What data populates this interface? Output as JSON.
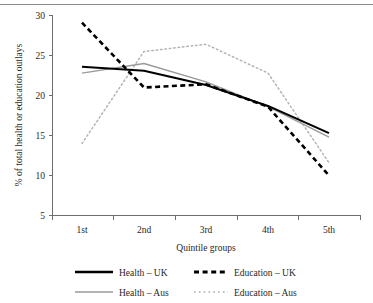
{
  "chart_data": {
    "type": "line",
    "title": "",
    "xlabel": "Quintile groups",
    "ylabel": "% of total health or education outlays",
    "categories": [
      "1st",
      "2nd",
      "3rd",
      "4th",
      "5th"
    ],
    "ylim": [
      5,
      30
    ],
    "yticks": [
      5,
      10,
      15,
      20,
      25,
      30
    ],
    "grid": false,
    "legend_position": "bottom",
    "series": [
      {
        "name": "Health – UK",
        "color": "#000000",
        "style": "solid",
        "values": [
          23.6,
          23.1,
          21.3,
          18.7,
          15.3
        ]
      },
      {
        "name": "Education – UK",
        "color": "#000000",
        "style": "dashed",
        "values": [
          29.1,
          21.0,
          21.4,
          18.6,
          10.0
        ]
      },
      {
        "name": "Health – Aus",
        "color": "#9a9a9a",
        "style": "solid",
        "values": [
          22.8,
          24.0,
          21.7,
          18.6,
          14.8
        ]
      },
      {
        "name": "Education – Aus",
        "color": "#b4b4b4",
        "style": "dotted",
        "values": [
          14.0,
          25.5,
          26.4,
          22.8,
          11.6
        ]
      }
    ]
  },
  "axes": {
    "y_tick_labels": [
      "30",
      "25",
      "20",
      "15",
      "10",
      "5"
    ],
    "x_tick_labels": [
      "1st",
      "2nd",
      "3rd",
      "4th",
      "5th"
    ],
    "x_axis_title": "Quintile groups",
    "y_axis_title": "% of total health or education outlays"
  },
  "legend": {
    "items": [
      {
        "label": "Health – UK"
      },
      {
        "label": "Education – UK"
      },
      {
        "label": "Health – Aus"
      },
      {
        "label": "Education – Aus"
      }
    ]
  }
}
